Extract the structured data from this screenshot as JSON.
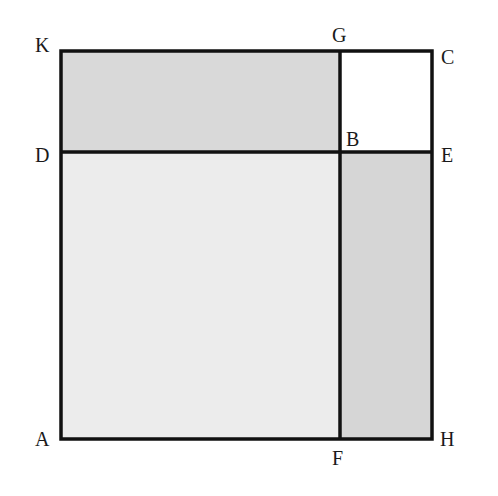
{
  "diagram": {
    "type": "geometric-rectangle-partition",
    "colors": {
      "stroke": "#111111",
      "region_KGBD": "#d9d9d9",
      "region_GCEB": "#ffffff",
      "region_DBFA": "#ececec",
      "region_BEHF": "#d6d6d6"
    },
    "points": {
      "K": {
        "label": "K",
        "x": 61,
        "y": 51
      },
      "G": {
        "label": "G",
        "x": 340,
        "y": 51
      },
      "C": {
        "label": "C",
        "x": 432,
        "y": 51
      },
      "D": {
        "label": "D",
        "x": 61,
        "y": 152
      },
      "B": {
        "label": "B",
        "x": 340,
        "y": 152
      },
      "E": {
        "label": "E",
        "x": 432,
        "y": 152
      },
      "A": {
        "label": "A",
        "x": 61,
        "y": 439
      },
      "F": {
        "label": "F",
        "x": 340,
        "y": 439
      },
      "H": {
        "label": "H",
        "x": 432,
        "y": 439
      }
    },
    "regions": [
      {
        "name": "KGBD",
        "shade": "medium-gray"
      },
      {
        "name": "GCEB",
        "shade": "white"
      },
      {
        "name": "DBFA",
        "shade": "light-gray"
      },
      {
        "name": "BEHF",
        "shade": "medium-gray"
      }
    ],
    "segments": [
      "KC",
      "DE",
      "AH",
      "KA",
      "GF",
      "CH"
    ]
  }
}
